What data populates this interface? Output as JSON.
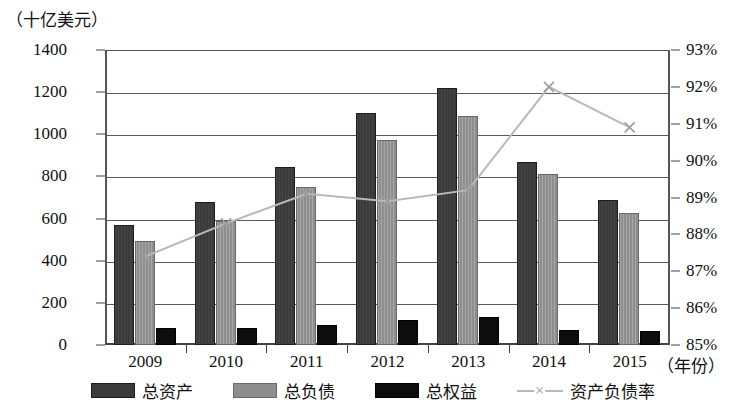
{
  "chart_data": {
    "type": "bar",
    "title": "",
    "unit_label": "（十亿美元）",
    "xlabel": "（年份）",
    "ylabel": "",
    "categories": [
      "2009",
      "2010",
      "2011",
      "2012",
      "2013",
      "2014",
      "2015"
    ],
    "ylim": [
      0,
      1400
    ],
    "yticks": [
      "0",
      "200",
      "400",
      "600",
      "800",
      "1000",
      "1200",
      "1400"
    ],
    "y2lim": [
      85,
      93
    ],
    "y2ticks": [
      "85%",
      "86%",
      "87%",
      "88%",
      "89%",
      "90%",
      "91%",
      "92%",
      "93%"
    ],
    "grid": true,
    "legend_position": "bottom",
    "series": [
      {
        "name": "总资产",
        "type": "bar",
        "axis": "left",
        "color": "#3b3b3b",
        "values": [
          570,
          680,
          845,
          1100,
          1220,
          870,
          690
        ]
      },
      {
        "name": "总负债",
        "type": "bar",
        "axis": "left",
        "color": "#8e8e8e",
        "values": [
          495,
          590,
          750,
          975,
          1085,
          810,
          625
        ]
      },
      {
        "name": "总权益",
        "type": "bar",
        "axis": "left",
        "color": "#0d0d0d",
        "values": [
          80,
          80,
          95,
          120,
          135,
          70,
          65
        ]
      },
      {
        "name": "资产负债率",
        "type": "line",
        "axis": "right",
        "color": "#b9b9b9",
        "marker": "x",
        "values": [
          87.4,
          88.3,
          89.1,
          88.9,
          89.2,
          92.0,
          90.9
        ]
      }
    ]
  },
  "legend": {
    "items": [
      {
        "label": "总资产",
        "swatch": "assets"
      },
      {
        "label": "总负债",
        "swatch": "liab"
      },
      {
        "label": "总权益",
        "swatch": "equity"
      },
      {
        "label": "资产负债率",
        "swatch": "ratio"
      }
    ]
  }
}
